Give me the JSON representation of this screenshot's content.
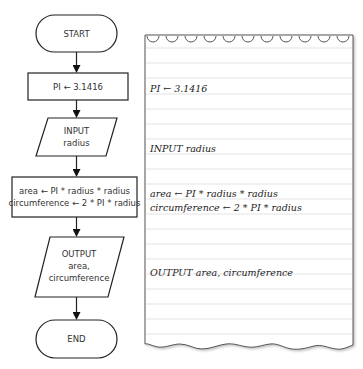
{
  "flowchart": {
    "start": {
      "label": "START"
    },
    "assign_pi": {
      "label": "PI ← 3.1416"
    },
    "input": {
      "line1": "INPUT",
      "line2": "radius"
    },
    "process": {
      "line1": "area ← PI * radius * radius",
      "line2": "circumference ← 2 * PI * radius"
    },
    "output": {
      "line1": "OUTPUT",
      "line2": "area,",
      "line3": "circumference"
    },
    "end": {
      "label": "END"
    }
  },
  "pseudocode": {
    "lines": [
      "PI ← 3.1416",
      "INPUT radius",
      "area ← PI * radius * radius",
      "circumference ← 2 * PI * radius",
      "OUTPUT area, circumference"
    ]
  },
  "colors": {
    "stroke": "#222222",
    "paper_line": "#dcdcdc",
    "paper_edge": "#555555"
  }
}
